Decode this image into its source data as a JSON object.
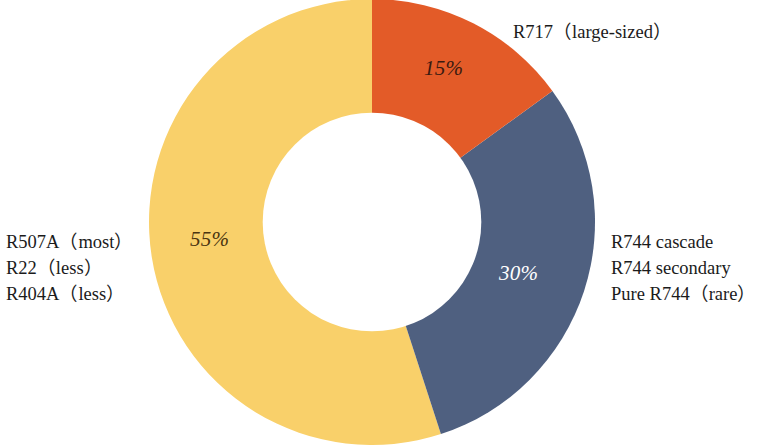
{
  "chart_data": {
    "type": "pie",
    "variant": "donut",
    "title": "",
    "subtitle": "",
    "xlabel": "",
    "ylabel": "",
    "legend_position": "outside-callouts",
    "grid": false,
    "start_angle_deg": 0,
    "direction": "clockwise",
    "inner_radius_ratio": 0.49,
    "categories": [
      "R717 (large-sized)",
      "R744 cascade / R744 secondary / Pure R744 (rare)",
      "R507A (most) / R22 (less) / R404A (less)"
    ],
    "values": [
      15,
      30,
      55
    ],
    "value_labels": [
      "15%",
      "30%",
      "55%"
    ],
    "colors": [
      "#E35B28",
      "#4F6080",
      "#F9D06A"
    ],
    "slices": [
      {
        "name": "R717",
        "value": 15,
        "value_label": "15%",
        "color": "#E35B28",
        "value_text_color": "#3a1a10",
        "start_deg": 0,
        "end_deg": 54
      },
      {
        "name": "R744",
        "value": 30,
        "value_label": "30%",
        "color": "#4F6080",
        "value_text_color": "#ffffff",
        "start_deg": 54,
        "end_deg": 162
      },
      {
        "name": "R507A/R22/R404A",
        "value": 55,
        "value_label": "55%",
        "color": "#F9D06A",
        "value_text_color": "#4a3410",
        "start_deg": 162,
        "end_deg": 360
      }
    ]
  },
  "callouts": {
    "r717": {
      "lines": [
        "R717（large-sized）"
      ]
    },
    "r744": {
      "lines": [
        "R744 cascade",
        "R744 secondary",
        "Pure R744（rare）"
      ]
    },
    "r507a": {
      "lines": [
        "R507A（most）",
        "R22（less）",
        "R404A（less）"
      ]
    }
  },
  "values": {
    "orange": "15%",
    "blue": "30%",
    "yellow": "55%"
  }
}
